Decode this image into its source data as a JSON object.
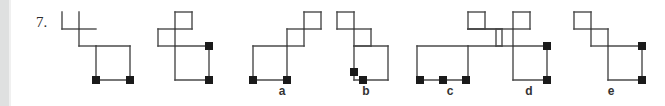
{
  "page": {
    "width": 665,
    "height": 106,
    "background": "#ffffff",
    "gutter_color": "#dfe0e0"
  },
  "question": {
    "number_label": "7.",
    "stroke_color": "#4a4a4a",
    "marker_color": "#1a1a1a",
    "cell_size": 17,
    "stroke_width": 1.4,
    "marker_size": 8
  },
  "prompt_figures": [
    {
      "name": "prompt-figure-1",
      "left": 58,
      "width": 80,
      "height": 76,
      "polyline": "4,4 21,4 21,21 38,21 38,38 72,38 72,72 38,72 38,21",
      "extra_lines": [
        "4,4 4,21",
        "4,21 21,21",
        "21,4 21,21",
        "21,21 38,21",
        "21,21 21,38",
        "21,38 38,38",
        "38,38 38,72",
        "38,38 72,38",
        "72,38 72,72",
        "38,72 72,72"
      ],
      "markers": [
        {
          "x": 38,
          "y": 72
        },
        {
          "x": 72,
          "y": 72
        }
      ]
    },
    {
      "name": "prompt-figure-2",
      "left": 145,
      "width": 80,
      "height": 76,
      "extra_lines": [
        "30,4 47,4",
        "30,4 30,21",
        "47,4 47,21",
        "30,21 47,21",
        "13,21 30,21",
        "13,21 13,38",
        "13,38 30,38",
        "30,21 30,38",
        "30,38 30,72",
        "30,38 64,38",
        "64,38 64,72",
        "30,72 64,72"
      ],
      "markers": [
        {
          "x": 64,
          "y": 38
        },
        {
          "x": 64,
          "y": 72
        }
      ]
    }
  ],
  "options": [
    {
      "name": "option-a",
      "label": "a",
      "left": 249,
      "label_left": 272,
      "width": 85,
      "height": 76,
      "extra_lines": [
        "55,4 72,4",
        "55,4 55,21",
        "72,4 72,21",
        "55,21 72,21",
        "38,21 55,21",
        "38,21 38,38",
        "38,38 55,38",
        "55,21 55,38",
        "4,38 38,38",
        "4,38 4,72",
        "38,38 38,72",
        "4,72 38,72"
      ],
      "markers": [
        {
          "x": 4,
          "y": 72
        },
        {
          "x": 38,
          "y": 72
        }
      ]
    },
    {
      "name": "option-b",
      "label": "b",
      "left": 333,
      "label_left": 356,
      "width": 85,
      "height": 76,
      "extra_lines": [
        "4,4 21,4",
        "4,4 4,21",
        "21,4 21,21",
        "4,21 21,21",
        "21,21 38,21",
        "21,21 21,38",
        "21,38 38,38",
        "38,21 38,38",
        "21,38 21,72",
        "21,38 55,38",
        "55,38 55,72",
        "21,72 55,72"
      ],
      "markers": [
        {
          "x": 21,
          "y": 64
        },
        {
          "x": 30,
          "y": 72
        }
      ]
    },
    {
      "name": "option-c",
      "label": "c",
      "left": 413,
      "label_left": 440,
      "width": 95,
      "height": 76,
      "extra_lines": [
        "55,4 72,4",
        "55,4 55,21",
        "72,4 72,21",
        "55,21 72,21",
        "55,21 72,21",
        "55,21 89,21",
        "72,21 89,21",
        "89,21 89,38",
        "55,38 89,38",
        "4,38 55,38",
        "4,38 4,72",
        "55,38 55,72",
        "4,72 55,72"
      ],
      "markers": [
        {
          "x": 7,
          "y": 72
        },
        {
          "x": 30,
          "y": 72
        },
        {
          "x": 53,
          "y": 72
        }
      ]
    },
    {
      "name": "option-d",
      "label": "d",
      "left": 492,
      "label_left": 519,
      "width": 85,
      "height": 76,
      "extra_lines": [
        "21,4 38,4",
        "21,4 21,21",
        "38,4 38,21",
        "21,21 38,21",
        "4,21 21,21",
        "4,21 4,38",
        "4,38 21,38",
        "21,21 21,38",
        "21,38 21,72",
        "21,38 55,38",
        "55,38 55,72",
        "21,72 55,72"
      ],
      "markers": [
        {
          "x": 55,
          "y": 38
        },
        {
          "x": 55,
          "y": 72
        }
      ]
    },
    {
      "name": "option-e",
      "label": "e",
      "left": 570,
      "label_left": 601,
      "width": 85,
      "height": 76,
      "extra_lines": [
        "4,4 21,4",
        "4,4 4,21",
        "21,4 21,21",
        "4,21 21,21",
        "21,21 38,21",
        "21,21 21,38",
        "21,38 38,38",
        "38,21 38,38",
        "38,38 38,72",
        "38,38 72,38",
        "72,38 72,72",
        "38,72 72,72"
      ],
      "markers": [
        {
          "x": 72,
          "y": 38
        },
        {
          "x": 72,
          "y": 72
        }
      ]
    }
  ]
}
